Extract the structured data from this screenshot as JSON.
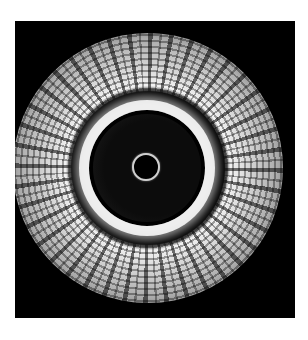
{
  "image": {
    "subject": "intravascular ultrasound cross-section",
    "elements": [
      {
        "name": "outer-tissue-ring",
        "description": "echogenic speckled vessel wall"
      },
      {
        "name": "bright-intimal-ring",
        "description": "bright inner boundary"
      },
      {
        "name": "lumen",
        "description": "dark vessel lumen"
      },
      {
        "name": "catheter",
        "description": "small ring at center"
      }
    ],
    "colors": {
      "background": "#ffffff",
      "frame": "#000000",
      "tissue": "#d9d9d9"
    }
  }
}
